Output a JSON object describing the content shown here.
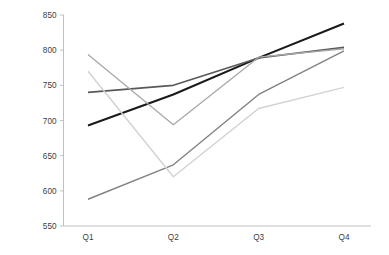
{
  "chart_data": {
    "type": "line",
    "title": "",
    "subtitle": "",
    "xlabel": "",
    "ylabel": "",
    "categories": [
      "Q1",
      "Q2",
      "Q3",
      "Q4"
    ],
    "ylim": [
      550,
      850
    ],
    "yticks": [
      550,
      600,
      650,
      700,
      750,
      800,
      850
    ],
    "ytick_labels": [
      "550",
      "600",
      "650",
      "700",
      "750",
      "800",
      "850"
    ],
    "grid": false,
    "legend": "none",
    "series": [
      {
        "name": "series-1",
        "color": "#1a1a1a",
        "width": 2.1,
        "values": [
          693,
          737,
          789,
          838
        ]
      },
      {
        "name": "series-2",
        "color": "#595959",
        "width": 1.6,
        "values": [
          740,
          750,
          789,
          804
        ]
      },
      {
        "name": "series-3",
        "color": "#828282",
        "width": 1.4,
        "values": [
          588,
          637,
          737,
          799
        ]
      },
      {
        "name": "series-4",
        "color": "#a8a8a8",
        "width": 1.3,
        "values": [
          794,
          694,
          790,
          802
        ]
      },
      {
        "name": "series-5",
        "color": "#d2d2d2",
        "width": 1.4,
        "values": [
          770,
          620,
          717,
          747
        ]
      }
    ]
  },
  "axis": {
    "x_labels": [
      "Q1",
      "Q2",
      "Q3",
      "Q4"
    ],
    "y_labels": [
      "850",
      "800",
      "750",
      "700",
      "650",
      "600",
      "550"
    ]
  }
}
